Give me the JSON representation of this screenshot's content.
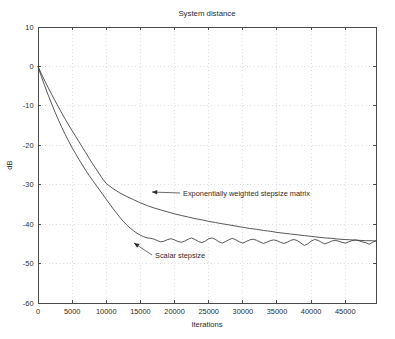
{
  "chart_data": {
    "type": "line",
    "title": "System distance",
    "xlabel": "Iterations",
    "ylabel": "dB",
    "grid": true,
    "legend_position": "inline-annotations",
    "xlim": [
      0,
      49500
    ],
    "ylim": [
      -60,
      10
    ],
    "xticks": [
      0,
      5000,
      10000,
      15000,
      20000,
      25000,
      30000,
      35000,
      40000,
      45000
    ],
    "xticklabels": [
      "0",
      "5000",
      "10000",
      "15000",
      "20000",
      "25000",
      "30000",
      "35000",
      "40000",
      "45000"
    ],
    "yticks": [
      10,
      0,
      -10,
      -20,
      -30,
      -40,
      -50,
      -60
    ],
    "yticklabels": [
      "10",
      "0",
      "-10",
      "-20",
      "-30",
      "-40",
      "-50",
      "-60"
    ],
    "series": [
      {
        "name": "Exponentially weighted stepsize matrix",
        "x": [
          0,
          500,
          1000,
          1500,
          2000,
          2500,
          3000,
          3500,
          4000,
          4500,
          5000,
          5500,
          6000,
          6500,
          7000,
          7500,
          8000,
          8500,
          9000,
          9500,
          10000,
          11000,
          12000,
          13000,
          14000,
          15000,
          16000,
          17000,
          18000,
          19000,
          20000,
          21000,
          22000,
          23000,
          24000,
          25000,
          26000,
          27000,
          28000,
          29000,
          30000,
          31000,
          32000,
          33000,
          34000,
          35000,
          36000,
          37000,
          38000,
          39000,
          40000,
          41000,
          42000,
          43000,
          44000,
          45000,
          46000,
          47000,
          48000,
          49000,
          49500
        ],
        "values": [
          0.0,
          -1.9,
          -3.7,
          -5.4,
          -7.1,
          -8.7,
          -10.3,
          -11.9,
          -13.4,
          -14.9,
          -16.3,
          -17.7,
          -19.1,
          -20.5,
          -21.9,
          -23.3,
          -24.7,
          -26.0,
          -27.3,
          -28.6,
          -29.7,
          -31.0,
          -32.1,
          -33.0,
          -33.8,
          -34.6,
          -35.3,
          -35.9,
          -36.4,
          -36.9,
          -37.4,
          -37.8,
          -38.2,
          -38.6,
          -38.9,
          -39.3,
          -39.6,
          -39.9,
          -40.2,
          -40.5,
          -40.8,
          -41.1,
          -41.3,
          -41.6,
          -41.8,
          -42.1,
          -42.3,
          -42.5,
          -42.7,
          -42.9,
          -43.1,
          -43.3,
          -43.5,
          -43.6,
          -43.8,
          -43.9,
          -44.0,
          -44.1,
          -44.2,
          -44.2,
          -44.3
        ]
      },
      {
        "name": "Scalar stepsize",
        "x": [
          0,
          500,
          1000,
          1500,
          2000,
          2500,
          3000,
          3500,
          4000,
          4500,
          5000,
          5500,
          6000,
          6500,
          7000,
          7500,
          8000,
          8500,
          9000,
          9500,
          10000,
          10500,
          11000,
          11500,
          12000,
          12500,
          13000,
          13500,
          14000,
          14500,
          15000,
          15500,
          16000,
          16500,
          17000,
          17500,
          18000,
          18500,
          19000,
          19500,
          20000,
          20500,
          21000,
          21500,
          22000,
          22500,
          23000,
          23500,
          24000,
          24500,
          25000,
          25500,
          26000,
          26500,
          27000,
          27500,
          28000,
          28500,
          29000,
          29500,
          30000,
          30500,
          31000,
          31500,
          32000,
          32500,
          33000,
          33500,
          34000,
          34500,
          35000,
          35500,
          36000,
          36500,
          37000,
          37500,
          38000,
          38500,
          39000,
          39500,
          40000,
          40500,
          41000,
          41500,
          42000,
          42500,
          43000,
          43500,
          44000,
          44500,
          45000,
          45500,
          46000,
          46500,
          47000,
          47500,
          48000,
          48500,
          49000,
          49500
        ],
        "values": [
          0.0,
          -2.6,
          -5.0,
          -7.3,
          -9.5,
          -11.6,
          -13.6,
          -15.5,
          -17.3,
          -19.0,
          -20.6,
          -22.1,
          -23.6,
          -25.0,
          -26.4,
          -27.7,
          -28.9,
          -30.1,
          -31.3,
          -32.5,
          -33.7,
          -34.9,
          -36.1,
          -37.2,
          -38.3,
          -39.3,
          -40.2,
          -41.0,
          -41.7,
          -42.3,
          -42.8,
          -43.2,
          -43.5,
          -43.6,
          -43.8,
          -44.2,
          -44.5,
          -44.3,
          -43.9,
          -43.7,
          -44.0,
          -44.4,
          -44.6,
          -44.3,
          -43.8,
          -43.5,
          -43.9,
          -44.4,
          -44.7,
          -44.3,
          -43.7,
          -43.5,
          -43.9,
          -44.5,
          -44.8,
          -44.4,
          -43.9,
          -43.6,
          -44.0,
          -44.5,
          -44.8,
          -44.4,
          -44.0,
          -43.8,
          -44.1,
          -44.5,
          -44.9,
          -44.6,
          -44.2,
          -44.0,
          -44.2,
          -44.6,
          -44.9,
          -44.6,
          -44.1,
          -43.9,
          -44.2,
          -44.8,
          -45.4,
          -45.0,
          -44.3,
          -43.9,
          -44.1,
          -44.6,
          -45.0,
          -44.7,
          -44.3,
          -44.1,
          -44.3,
          -44.6,
          -44.8,
          -44.5,
          -44.2,
          -44.0,
          -44.2,
          -44.5,
          -44.7,
          -45.1,
          -44.6,
          -44.2
        ]
      }
    ],
    "annotations": [
      {
        "name": "exponentially-weighted-stepsize-matrix",
        "text": "Exponentially weighted stepsize matrix",
        "text_x": 183,
        "text_y": 196,
        "leader_from_x": 180,
        "leader_from_y": 193,
        "leader_to_x": 152,
        "leader_to_y": 192,
        "arrow_dir": "left"
      },
      {
        "name": "scalar-stepsize",
        "text": "Scalar stepsize",
        "text_x": 155,
        "text_y": 258,
        "leader_from_x": 152,
        "leader_from_y": 255,
        "leader_to_x": 134,
        "leader_to_y": 243,
        "arrow_dir": "upleft"
      }
    ],
    "colors": {
      "line": "#3a3a3a",
      "axis": "#4a4a4a",
      "grid": "#c9c9c9",
      "background": "#ffffff",
      "text": "#2b2b2b"
    }
  }
}
